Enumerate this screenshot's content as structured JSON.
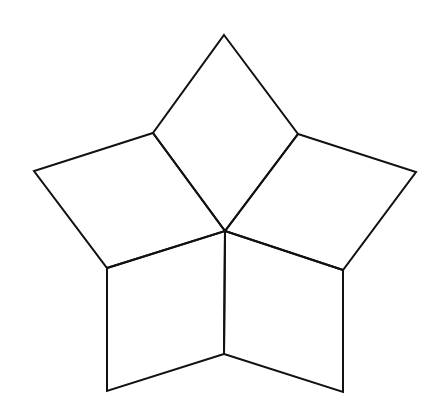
{
  "diagram": {
    "title": "Star figure composed of five quadrilaterals meeting at a central point",
    "stroke_color": "#111111",
    "background": "#ffffff",
    "stroke_width": 2,
    "vertices": {
      "top": [
        224,
        35
      ],
      "upper_left_inner": [
        153,
        133
      ],
      "upper_right_inner": [
        298,
        134
      ],
      "left_outer": [
        34,
        171
      ],
      "right_outer": [
        416,
        172
      ],
      "center": [
        225,
        231
      ],
      "lower_left_inner": [
        107,
        268
      ],
      "lower_right_inner": [
        343,
        270
      ],
      "bottom_center": [
        224,
        354
      ],
      "bottom_left": [
        107,
        391
      ],
      "bottom_right": [
        343,
        392
      ]
    },
    "pieces": [
      {
        "name": "top-rhombus",
        "points": "224,35 298,134 225,231 153,133"
      },
      {
        "name": "left-rhombus",
        "points": "153,133 225,231 107,268 34,171"
      },
      {
        "name": "right-rhombus",
        "points": "298,134 416,172 343,270 225,231"
      },
      {
        "name": "bottom-left-quad",
        "points": "107,268 225,231 224,354 107,391"
      },
      {
        "name": "bottom-right-quad",
        "points": "225,231 343,270 343,392 224,354"
      }
    ]
  }
}
